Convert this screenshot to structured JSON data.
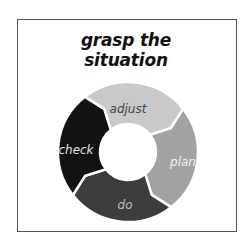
{
  "title": {
    "line1": "grasp the",
    "line2": "situation"
  },
  "cycle": {
    "center": [
      128,
      152
    ],
    "outer_radius": 70,
    "inner_radius": 28,
    "gap_color": "#ffffff",
    "segments": [
      {
        "label": "adjust",
        "fill": "#c9c9c9",
        "text_color": "#444444",
        "start_deg": -128,
        "end_deg": -38,
        "label_pos": [
          128,
          109
        ]
      },
      {
        "label": "plan",
        "fill": "#a2a2a2",
        "text_color": "#f2f2f2",
        "start_deg": -38,
        "end_deg": 52,
        "label_pos": [
          183,
          162
        ]
      },
      {
        "label": "do",
        "fill": "#3d3d3d",
        "text_color": "#bdbdbd",
        "start_deg": 52,
        "end_deg": 142,
        "label_pos": [
          125,
          205
        ]
      },
      {
        "label": "check",
        "fill": "#121212",
        "text_color": "#e0e0e0",
        "start_deg": 142,
        "end_deg": 232,
        "label_pos": [
          76,
          150
        ]
      }
    ]
  }
}
